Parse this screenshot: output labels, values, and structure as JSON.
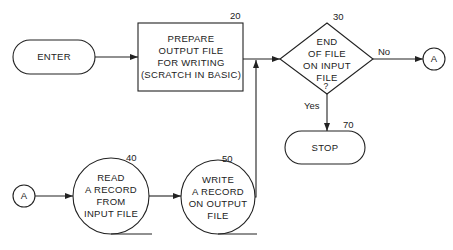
{
  "diagram": {
    "type": "flowchart",
    "nodes": [
      {
        "id": "enter",
        "shape": "terminal",
        "label": "ENTER",
        "number": ""
      },
      {
        "id": "prepare",
        "shape": "process",
        "label": "PREPARE\nOUTPUT FILE\nFOR WRITING\n(SCRATCH IN BASIC)",
        "number": "20"
      },
      {
        "id": "eof",
        "shape": "decision",
        "label": "END\nOF FILE\nON INPUT\nFILE\n?",
        "number": "30"
      },
      {
        "id": "connector_a_out",
        "shape": "connector",
        "label": "A",
        "number": ""
      },
      {
        "id": "stop",
        "shape": "terminal",
        "label": "STOP",
        "number": "70"
      },
      {
        "id": "connector_a_in",
        "shape": "connector",
        "label": "A",
        "number": ""
      },
      {
        "id": "read",
        "shape": "input-output-circle",
        "label": "READ\nA RECORD\nFROM\nINPUT FILE",
        "number": "40"
      },
      {
        "id": "write",
        "shape": "input-output-circle",
        "label": "WRITE\nA RECORD\nON OUTPUT\nFILE",
        "number": "50"
      }
    ],
    "edges": [
      {
        "from": "enter",
        "to": "prepare",
        "label": ""
      },
      {
        "from": "prepare",
        "to": "eof",
        "label": ""
      },
      {
        "from": "eof",
        "to": "connector_a_out",
        "label": "No"
      },
      {
        "from": "eof",
        "to": "stop",
        "label": "Yes"
      },
      {
        "from": "connector_a_in",
        "to": "read",
        "label": ""
      },
      {
        "from": "read",
        "to": "write",
        "label": ""
      },
      {
        "from": "write",
        "to": "eof",
        "label": ""
      }
    ]
  },
  "labels": {
    "enter": "ENTER",
    "prepare": "PREPARE\nOUTPUT FILE\nFOR WRITING\n(SCRATCH IN BASIC)",
    "prepare_num": "20",
    "eof": "END\nOF FILE\nON INPUT\nFILE",
    "eof_q": "?",
    "eof_num": "30",
    "no": "No",
    "yes": "Yes",
    "conn_out": "A",
    "stop": "STOP",
    "stop_num": "70",
    "conn_in": "A",
    "read": "READ\nA RECORD\nFROM\nINPUT FILE",
    "read_num": "40",
    "write": "WRITE\nA RECORD\nON OUTPUT\nFILE",
    "write_num": "50"
  }
}
